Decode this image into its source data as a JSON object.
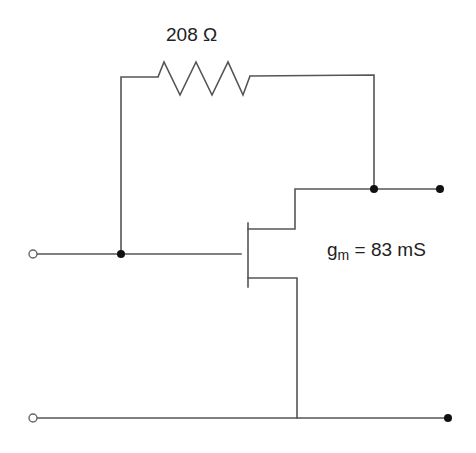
{
  "diagram": {
    "type": "circuit-schematic",
    "title": "",
    "components": {
      "feedback_resistor": {
        "label": "208 Ω",
        "value": "208",
        "unit": "Ω"
      },
      "transistor": {
        "type": "FET",
        "transconductance_symbol": "g",
        "transconductance_subscript": "m",
        "transconductance_equals": " = 83 mS",
        "transconductance_value": "83",
        "transconductance_unit": "mS"
      }
    },
    "nodes": {
      "input_terminal": "open",
      "ground_input_terminal": "open",
      "output_terminal": "filled",
      "ground_output_terminal": "filled"
    },
    "colors": {
      "wire": "#555555",
      "dot": "#111111",
      "background": "#ffffff"
    }
  }
}
